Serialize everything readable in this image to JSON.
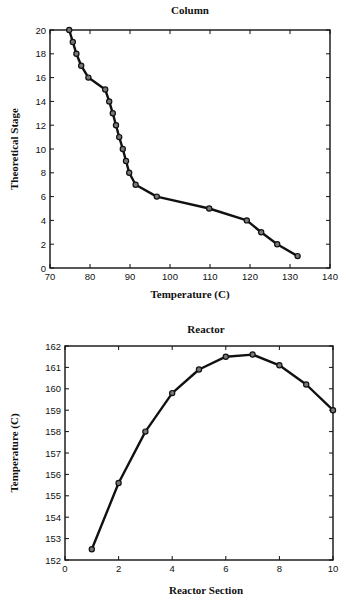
{
  "chart_data": [
    {
      "type": "line",
      "title": "Column",
      "xlabel": "Temperature (C)",
      "ylabel": "Theoretical Stage",
      "xlim": [
        70,
        140
      ],
      "ylim": [
        0,
        20
      ],
      "xticks": [
        70,
        80,
        90,
        100,
        110,
        120,
        130,
        140
      ],
      "yticks": [
        0,
        2,
        4,
        6,
        8,
        10,
        12,
        14,
        16,
        18,
        20
      ],
      "grid": false,
      "markers": true,
      "series": [
        {
          "name": "Column profile",
          "x": [
            74.8,
            75.7,
            76.6,
            77.8,
            79.6,
            83.8,
            84.8,
            85.7,
            86.5,
            87.3,
            88.2,
            89.0,
            89.8,
            91.4,
            96.7,
            109.8,
            119.2,
            122.8,
            126.8,
            131.9
          ],
          "y": [
            20,
            19,
            18,
            17,
            16,
            15,
            14,
            13,
            12,
            11,
            10,
            9,
            8,
            7,
            6,
            5,
            4,
            3,
            2,
            1
          ]
        }
      ]
    },
    {
      "type": "line",
      "title": "Reactor",
      "xlabel": "Reactor Section",
      "ylabel": "Temperature (C)",
      "xlim": [
        0,
        10
      ],
      "ylim": [
        152,
        162
      ],
      "xticks": [
        0,
        2,
        4,
        6,
        8,
        10
      ],
      "yticks": [
        152,
        153,
        154,
        155,
        156,
        157,
        158,
        159,
        160,
        161,
        162
      ],
      "grid": false,
      "markers": true,
      "series": [
        {
          "name": "Reactor profile",
          "x": [
            1,
            2,
            3,
            4,
            5,
            6,
            7,
            8,
            9,
            10
          ],
          "y": [
            152.5,
            155.6,
            158.0,
            159.8,
            160.9,
            161.5,
            161.6,
            161.1,
            160.2,
            159.0
          ]
        }
      ]
    }
  ]
}
